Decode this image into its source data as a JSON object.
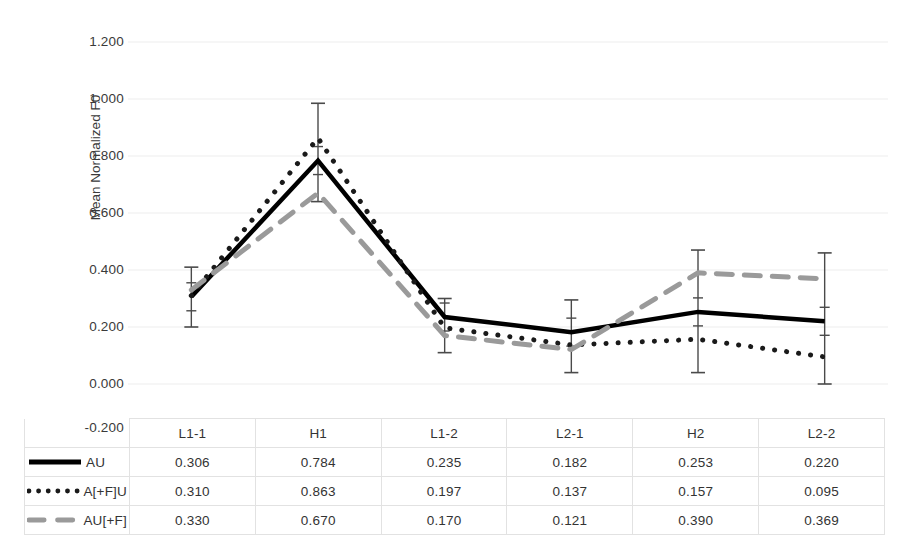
{
  "chart_data": {
    "type": "line",
    "title": "",
    "xlabel": "",
    "ylabel": "Mean Normalized F0",
    "categories": [
      "L1-1",
      "H1",
      "L1-2",
      "L2-1",
      "H2",
      "L2-2"
    ],
    "ylim": [
      -0.2,
      1.2
    ],
    "yticks": [
      "1.200",
      "1.000",
      "0.800",
      "0.600",
      "0.400",
      "0.200",
      "0.000",
      "-0.200"
    ],
    "ytick_values": [
      1.2,
      1.0,
      0.8,
      0.6,
      0.4,
      0.2,
      0.0,
      -0.2
    ],
    "grid": true,
    "legend_position": "table-left",
    "series": [
      {
        "name": "AU",
        "style": "solid",
        "color": "#000000",
        "values": [
          0.306,
          0.784,
          0.235,
          0.182,
          0.253,
          0.22
        ],
        "error_low": [
          0.2,
          0.64,
          0.11,
          0.04,
          0.04,
          0.0
        ],
        "error_high": [
          0.41,
          0.985,
          0.3,
          0.295,
          0.47,
          0.46
        ]
      },
      {
        "name": "A[+F]U",
        "style": "dotted",
        "color": "#1a1a1a",
        "values": [
          0.31,
          0.863,
          0.197,
          0.137,
          0.157,
          0.095
        ]
      },
      {
        "name": "AU[+F]",
        "style": "dashed",
        "color": "#9a9a9a",
        "values": [
          0.33,
          0.67,
          0.17,
          0.121,
          0.39,
          0.369
        ]
      }
    ]
  },
  "table": {
    "corner_label": "",
    "headers": [
      "L1-1",
      "H1",
      "L1-2",
      "L2-1",
      "H2",
      "L2-2"
    ],
    "rows": [
      {
        "label": "AU",
        "style": "solid",
        "values": [
          "0.306",
          "0.784",
          "0.235",
          "0.182",
          "0.253",
          "0.220"
        ]
      },
      {
        "label": "A[+F]U",
        "style": "dotted",
        "values": [
          "0.310",
          "0.863",
          "0.197",
          "0.137",
          "0.157",
          "0.095"
        ]
      },
      {
        "label": "AU[+F]",
        "style": "dashed",
        "values": [
          "0.330",
          "0.670",
          "0.170",
          "0.121",
          "0.390",
          "0.369"
        ]
      }
    ]
  },
  "axis": {
    "y_label": "Mean Normalized F0",
    "ticks": [
      "1.200",
      "1.000",
      "0.800",
      "0.600",
      "0.400",
      "0.200",
      "0.000",
      "-0.200"
    ]
  },
  "colors": {
    "series_solid": "#000000",
    "series_dotted": "#1a1a1a",
    "series_dashed": "#9a9a9a",
    "gridline": "#ededed",
    "text": "#333333"
  }
}
